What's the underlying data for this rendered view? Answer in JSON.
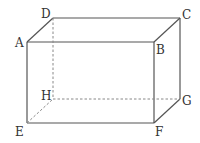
{
  "diagram": {
    "type": "rectangular-cuboid",
    "colors": {
      "edge": "#555555",
      "hidden_edge": "#888888",
      "label": "#333333",
      "background": "#ffffff"
    },
    "vertices": {
      "A": {
        "label": "A",
        "x": 27,
        "y": 42
      },
      "B": {
        "label": "B",
        "x": 154,
        "y": 42
      },
      "C": {
        "label": "C",
        "x": 180,
        "y": 18
      },
      "D": {
        "label": "D",
        "x": 53,
        "y": 18
      },
      "E": {
        "label": "E",
        "x": 27,
        "y": 123
      },
      "F": {
        "label": "F",
        "x": 154,
        "y": 123
      },
      "G": {
        "label": "G",
        "x": 180,
        "y": 99
      },
      "H": {
        "label": "H",
        "x": 53,
        "y": 99
      }
    },
    "visible_edges": [
      "AB",
      "BC",
      "CD",
      "DA",
      "AE",
      "BF",
      "CG",
      "EF",
      "FG"
    ],
    "hidden_edges": [
      "DH",
      "EH",
      "HG"
    ]
  }
}
